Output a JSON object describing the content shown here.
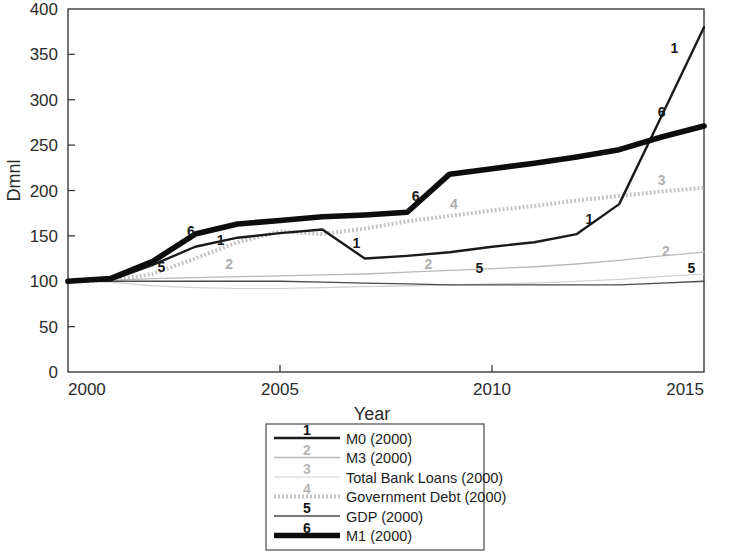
{
  "chart_data": {
    "type": "line",
    "title": "",
    "xlabel": "Year",
    "ylabel": "Dmnl",
    "xlim": [
      2000,
      2015
    ],
    "ylim": [
      0,
      400
    ],
    "xticks": [
      2000,
      2005,
      2010,
      2015
    ],
    "xtick_labels": [
      "2000",
      "2005",
      "2010",
      "2015"
    ],
    "yticks": [
      0,
      50,
      100,
      150,
      200,
      250,
      300,
      350,
      400
    ],
    "ytick_labels": [
      "0",
      "50",
      "100",
      "150",
      "200",
      "250",
      "300",
      "350",
      "400"
    ],
    "grid": false,
    "legend_position": "below-center",
    "x": [
      2000,
      2001,
      2002,
      2003,
      2004,
      2005,
      2006,
      2007,
      2008,
      2009,
      2010,
      2011,
      2012,
      2013,
      2014,
      2015
    ],
    "series": [
      {
        "name": "M0 (2000)",
        "marker_number": "1",
        "color": "#1a1a1a",
        "width": 2.4,
        "dash": "none",
        "values": [
          100,
          101,
          118,
          138,
          148,
          153,
          157,
          125,
          128,
          132,
          138,
          143,
          152,
          185,
          282,
          380
        ]
      },
      {
        "name": "M3 (2000)",
        "marker_number": "2",
        "color": "#b9b9b9",
        "width": 1.3,
        "dash": "none",
        "values": [
          100,
          101,
          103,
          104,
          105,
          106,
          107,
          108,
          110,
          112,
          114,
          116,
          119,
          123,
          128,
          132
        ]
      },
      {
        "name": "Total Bank Loans (2000)",
        "marker_number": "3",
        "color": "#cfcfcf",
        "width": 1.2,
        "dash": "none",
        "values": [
          100,
          99,
          95,
          93,
          92,
          92,
          93,
          94,
          95,
          96,
          97,
          98,
          100,
          102,
          105,
          108
        ]
      },
      {
        "name": "Government Debt (2000)",
        "marker_number": "4",
        "color": "#c4c4c4",
        "width": 4.0,
        "dash": "2,2",
        "values": [
          100,
          101,
          108,
          125,
          143,
          155,
          152,
          158,
          166,
          172,
          178,
          183,
          189,
          194,
          199,
          203
        ]
      },
      {
        "name": "GDP (2000)",
        "marker_number": "5",
        "color": "#4a4a4a",
        "width": 1.3,
        "dash": "none",
        "values": [
          100,
          100,
          100,
          100,
          100,
          100,
          99,
          98,
          97,
          96,
          96,
          96,
          96,
          96,
          98,
          100
        ]
      },
      {
        "name": "M1 (2000)",
        "marker_number": "6",
        "color": "#0d0d0d",
        "width": 5.6,
        "dash": "none",
        "values": [
          100,
          103,
          122,
          152,
          163,
          167,
          171,
          173,
          176,
          218,
          224,
          230,
          237,
          245,
          259,
          271
        ]
      }
    ],
    "inline_labels": [
      {
        "text": "6",
        "x": 2002.9,
        "y": 150
      },
      {
        "text": "1",
        "x": 2003.6,
        "y": 140
      },
      {
        "text": "5",
        "x": 2002.2,
        "y": 110
      },
      {
        "text": "2",
        "x": 2003.8,
        "y": 113
      },
      {
        "text": "6",
        "x": 2008.2,
        "y": 188
      },
      {
        "text": "4",
        "x": 2009.1,
        "y": 180
      },
      {
        "text": "1",
        "x": 2006.8,
        "y": 137
      },
      {
        "text": "2",
        "x": 2008.5,
        "y": 113
      },
      {
        "text": "5",
        "x": 2009.7,
        "y": 109
      },
      {
        "text": "1",
        "x": 2012.3,
        "y": 163
      },
      {
        "text": "3",
        "x": 2014.0,
        "y": 206
      },
      {
        "text": "6",
        "x": 2014.0,
        "y": 281
      },
      {
        "text": "1",
        "x": 2014.3,
        "y": 352
      },
      {
        "text": "2",
        "x": 2014.1,
        "y": 128
      },
      {
        "text": "5",
        "x": 2014.7,
        "y": 109
      }
    ]
  },
  "axis": {
    "y_title": "Dmnl",
    "x_title": "Year"
  },
  "legend": {
    "entries": [
      {
        "number": "1",
        "label": "M0 (2000)"
      },
      {
        "number": "2",
        "label": "M3 (2000)"
      },
      {
        "number": "3",
        "label": "Total Bank Loans (2000)"
      },
      {
        "number": "4",
        "label": "Government Debt (2000)"
      },
      {
        "number": "5",
        "label": "GDP (2000)"
      },
      {
        "number": "6",
        "label": "M1 (2000)"
      }
    ]
  }
}
